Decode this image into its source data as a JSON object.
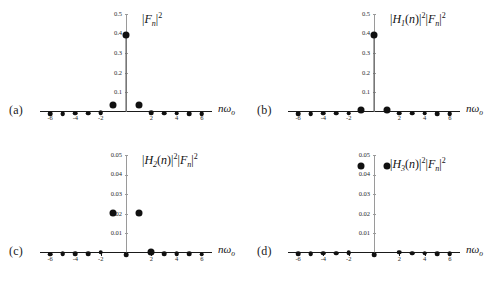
{
  "figure": {
    "background": "#ffffff",
    "marker_color": "#111111",
    "axis_color": "#1a1a1a",
    "gridline_color": "#9a9a9a"
  },
  "panels": [
    {
      "id": "a",
      "label": "(a)",
      "title": "|F_n|^2",
      "xlabel": "nω_o",
      "chart_data": {
        "type": "scatter",
        "title": "|F_n|²",
        "xlabel": "nω₀",
        "ylabel": "",
        "xlim": [
          -6.8,
          6.8
        ],
        "ylim": [
          0,
          0.5
        ],
        "yticks": [
          0.1,
          0.2,
          0.3,
          0.4,
          0.5
        ],
        "ytick_labels": [
          "0.1",
          "0.2",
          "0.3",
          "0.4",
          "0.5"
        ],
        "xticks": [
          -6,
          -4,
          -2,
          2,
          4,
          6
        ],
        "xtick_labels": [
          "-6",
          "-4",
          "-2",
          "2",
          "4",
          "6"
        ],
        "grid": false,
        "x": [
          -6,
          -5,
          -4,
          -3,
          -2,
          -1,
          0,
          1,
          2,
          3,
          4,
          5,
          6
        ],
        "values": [
          0.003,
          0.004,
          0.005,
          0.006,
          0.008,
          0.052,
          0.41,
          0.052,
          0.008,
          0.006,
          0.005,
          0.004,
          0.003
        ]
      }
    },
    {
      "id": "b",
      "label": "(b)",
      "title": "|H_1(n)|^2|F_n|^2",
      "xlabel": "nω_o",
      "chart_data": {
        "type": "scatter",
        "title": "|H₁(n)|²|Fₙ|²",
        "xlabel": "nω₀",
        "ylabel": "",
        "xlim": [
          -6.8,
          6.8
        ],
        "ylim": [
          0,
          0.5
        ],
        "yticks": [
          0.1,
          0.2,
          0.3,
          0.4,
          0.5
        ],
        "ytick_labels": [
          "0.1",
          "0.2",
          "0.3",
          "0.4",
          "0.5"
        ],
        "xticks": [
          -6,
          -4,
          -2,
          2,
          4,
          6
        ],
        "xtick_labels": [
          "-6",
          "-4",
          "-2",
          "2",
          "4",
          "6"
        ],
        "grid": false,
        "x": [
          -6,
          -5,
          -4,
          -3,
          -2,
          -1,
          0,
          1,
          2,
          3,
          4,
          5,
          6
        ],
        "values": [
          0.004,
          0.004,
          0.005,
          0.005,
          0.006,
          0.03,
          0.41,
          0.03,
          0.006,
          0.005,
          0.005,
          0.004,
          0.004
        ]
      }
    },
    {
      "id": "c",
      "label": "(c)",
      "title": "|H_2(n)|^2|F_n|^2",
      "xlabel": "nω_o",
      "chart_data": {
        "type": "scatter",
        "title": "|H₂(n)|²|Fₙ|²",
        "xlabel": "nω₀",
        "ylabel": "",
        "xlim": [
          -6.8,
          6.8
        ],
        "ylim": [
          0,
          0.05
        ],
        "yticks": [
          0.01,
          0.02,
          0.03,
          0.04,
          0.05
        ],
        "ytick_labels": [
          "0.01",
          "0.02",
          "0.03",
          "0.04",
          "0.05"
        ],
        "xticks": [
          -6,
          -4,
          -2,
          2,
          4,
          6
        ],
        "xtick_labels": [
          "-6",
          "-4",
          "-2",
          "2",
          "4",
          "6"
        ],
        "grid": false,
        "x": [
          -6,
          -5,
          -4,
          -3,
          -2,
          -1,
          0,
          1,
          2,
          3,
          4,
          5,
          6
        ],
        "values": [
          0.0006,
          0.0007,
          0.0008,
          0.0009,
          0.0015,
          0.0222,
          0.0003,
          0.0222,
          0.0022,
          0.0009,
          0.0008,
          0.0007,
          0.0006
        ]
      }
    },
    {
      "id": "d",
      "label": "(d)",
      "title": "|H_3(n)|^2|F_n|^2",
      "xlabel": "nω_o",
      "chart_data": {
        "type": "scatter",
        "title": "|H₃(n)|²|Fₙ|²",
        "xlabel": "nω₀",
        "ylabel": "",
        "xlim": [
          -6.8,
          6.8
        ],
        "ylim": [
          0,
          0.05
        ],
        "yticks": [
          0.01,
          0.02,
          0.03,
          0.04,
          0.05
        ],
        "ytick_labels": [
          "0.01",
          "0.02",
          "0.03",
          "0.04",
          "0.05"
        ],
        "xticks": [
          -6,
          -4,
          -2,
          2,
          4,
          6
        ],
        "xtick_labels": [
          "-6",
          "-4",
          "-2",
          "2",
          "4",
          "6"
        ],
        "grid": false,
        "x": [
          -6,
          -5,
          -4,
          -3,
          -2,
          -1,
          0,
          1,
          2,
          3,
          4,
          5,
          6
        ],
        "values": [
          0.0008,
          0.0009,
          0.001,
          0.001,
          0.0012,
          0.046,
          0.0004,
          0.046,
          0.0015,
          0.001,
          0.001,
          0.0009,
          0.0008
        ]
      }
    }
  ]
}
